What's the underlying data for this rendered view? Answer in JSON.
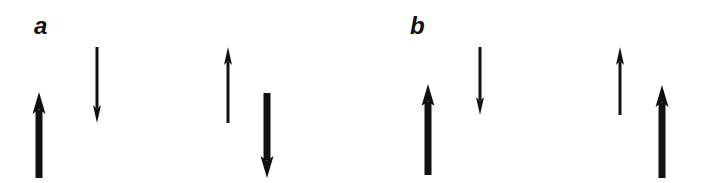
{
  "panels": [
    {
      "label": "a",
      "label_pos": {
        "x": 34,
        "y": 14
      },
      "arrows": [
        {
          "x": 39,
          "y_tail": 178,
          "y_head": 92,
          "direction": "up",
          "weight": "thick"
        },
        {
          "x": 97,
          "y_tail": 47,
          "y_head": 123,
          "direction": "down",
          "weight": "thin"
        },
        {
          "x": 228,
          "y_tail": 123,
          "y_head": 47,
          "direction": "up",
          "weight": "thin"
        },
        {
          "x": 267,
          "y_tail": 93,
          "y_head": 178,
          "direction": "down",
          "weight": "thick"
        }
      ]
    },
    {
      "label": "b",
      "label_pos": {
        "x": 410,
        "y": 14
      },
      "arrows": [
        {
          "x": 428,
          "y_tail": 175,
          "y_head": 84,
          "direction": "up",
          "weight": "thick"
        },
        {
          "x": 480,
          "y_tail": 47,
          "y_head": 115,
          "direction": "down",
          "weight": "thin"
        },
        {
          "x": 620,
          "y_tail": 115,
          "y_head": 47,
          "direction": "up",
          "weight": "thin"
        },
        {
          "x": 662,
          "y_tail": 178,
          "y_head": 85,
          "direction": "up",
          "weight": "thick"
        }
      ]
    }
  ],
  "style": {
    "arrow_color": "#111111",
    "thick_width": 7,
    "thin_width": 3,
    "thick_head": {
      "w": 13,
      "h": 22
    },
    "thin_head": {
      "w": 8,
      "h": 18
    }
  }
}
